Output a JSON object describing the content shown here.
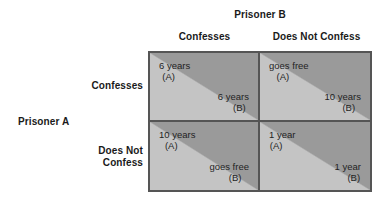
{
  "figure": {
    "column_player": "Prisoner B",
    "row_player": "Prisoner A",
    "column_headers": [
      "Confesses",
      "Does Not Confess"
    ],
    "row_headers": [
      "Confesses",
      "Does Not\nConfess"
    ],
    "row_headers_lines": [
      {
        "line1": "Confesses",
        "line2": ""
      },
      {
        "line1": "Does Not",
        "line2": "Confess"
      }
    ]
  },
  "colors": {
    "triangle_dark": "#9a9a9a",
    "triangle_light": "#c4c4c4",
    "border": "#555555",
    "background": "#ffffff",
    "text": "#1f1f1f"
  },
  "chart_data": {
    "type": "table",
    "title": "Prisoner B",
    "xlabel": "Prisoner B",
    "ylabel": "Prisoner A",
    "categories": [
      "Confesses",
      "Does Not Confess"
    ],
    "row_categories": [
      "Confesses",
      "Does Not Confess"
    ],
    "cells": [
      {
        "row": "Confesses",
        "column": "Confesses",
        "a_amount": "6 years",
        "a_who": "(A)",
        "b_amount": "6 years",
        "b_who": "(B)"
      },
      {
        "row": "Confesses",
        "column": "Does Not Confess",
        "a_amount": "goes free",
        "a_who": "(A)",
        "b_amount": "10 years",
        "b_who": "(B)"
      },
      {
        "row": "Does Not Confess",
        "column": "Confesses",
        "a_amount": "10 years",
        "a_who": "(A)",
        "b_amount": "goes free",
        "b_who": "(B)"
      },
      {
        "row": "Does Not Confess",
        "column": "Does Not Confess",
        "a_amount": "1 year",
        "a_who": "(A)",
        "b_amount": "1 year",
        "b_who": "(B)"
      }
    ]
  }
}
